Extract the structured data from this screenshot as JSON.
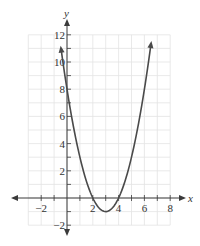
{
  "chart_data": {
    "type": "line",
    "title": "",
    "xlabel": "x",
    "ylabel": "y",
    "function": "y = x^2 - 6x + 8",
    "xlim": [
      -3,
      8
    ],
    "ylim": [
      -2,
      12
    ],
    "grid": true,
    "grid_step": 1,
    "x_ticks": [
      -2,
      0,
      2,
      4,
      6,
      8
    ],
    "x_tick_labels": [
      "-2",
      "2",
      "4",
      "6",
      "8"
    ],
    "x_labeled_values": [
      -2,
      2,
      4,
      6,
      8
    ],
    "y_ticks": [
      -2,
      0,
      2,
      4,
      6,
      8,
      10,
      12
    ],
    "y_tick_labels": [
      "-2",
      "2",
      "4",
      "6",
      "8",
      "10",
      "12"
    ],
    "y_labeled_values": [
      -2,
      2,
      4,
      6,
      8,
      10,
      12
    ],
    "series": [
      {
        "name": "parabola",
        "domain": [
          -0.45,
          6.5
        ],
        "roots": [
          2,
          4
        ],
        "vertex": [
          3,
          -1
        ],
        "y_intercept": 8,
        "arrows_both_ends": true,
        "points": [
          {
            "x": -0.45,
            "y": 11.0
          },
          {
            "x": 0,
            "y": 8
          },
          {
            "x": 1,
            "y": 3
          },
          {
            "x": 2,
            "y": 0
          },
          {
            "x": 3,
            "y": -1
          },
          {
            "x": 4,
            "y": 0
          },
          {
            "x": 5,
            "y": 3
          },
          {
            "x": 6,
            "y": 8
          },
          {
            "x": 6.5,
            "y": 11.25
          }
        ]
      }
    ],
    "colors": {
      "curve": "#4a4a4a",
      "axis": "#3a3a3a",
      "grid": "#e3e3e3",
      "text": "#333333"
    }
  }
}
